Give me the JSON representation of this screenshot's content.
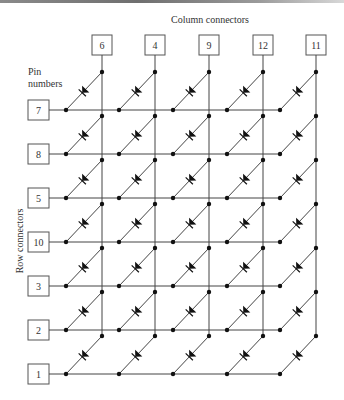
{
  "title": "Column connectors",
  "pin_label_line1": "Pin",
  "pin_label_line2": "numbers",
  "row_label": "Row connectors",
  "columns": [
    {
      "pin": "6",
      "x": 102
    },
    {
      "pin": "4",
      "x": 155
    },
    {
      "pin": "9",
      "x": 209
    },
    {
      "pin": "12",
      "x": 263
    },
    {
      "pin": "11",
      "x": 316
    }
  ],
  "rows": [
    {
      "pin": "7",
      "y": 110
    },
    {
      "pin": "8",
      "y": 154
    },
    {
      "pin": "5",
      "y": 198
    },
    {
      "pin": "10",
      "y": 242
    },
    {
      "pin": "3",
      "y": 286
    },
    {
      "pin": "2",
      "y": 330
    },
    {
      "pin": "1",
      "y": 374
    }
  ],
  "colors": {
    "line": "#444444",
    "node": "#111111",
    "box_border": "#555555",
    "text": "#333333"
  }
}
